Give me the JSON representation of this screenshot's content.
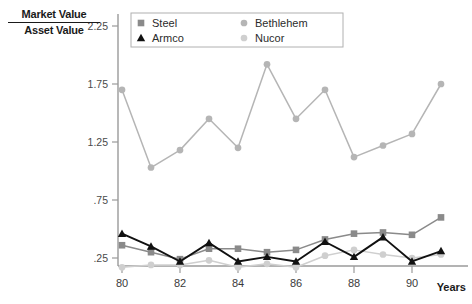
{
  "chart_data": {
    "type": "line",
    "title": "",
    "subtitle": "",
    "ylabel_numerator": "Market Value",
    "ylabel_denominator": "Asset Value",
    "xlabel": "Years",
    "x": [
      80,
      81,
      82,
      83,
      84,
      85,
      86,
      87,
      88,
      89,
      90,
      91
    ],
    "xtick_labels": [
      "80",
      "82",
      "84",
      "86",
      "88",
      "90"
    ],
    "xtick_values": [
      80,
      82,
      84,
      86,
      88,
      90
    ],
    "xlim": [
      79.5,
      91.5
    ],
    "ytick_labels": [
      "2.25",
      "1.75",
      "1.25",
      ".75",
      ".25"
    ],
    "ytick_values": [
      2.25,
      1.75,
      1.25,
      0.75,
      0.25
    ],
    "ylim": [
      0.0,
      2.45
    ],
    "grid": false,
    "legend_position": "top-right",
    "series": [
      {
        "name": "Steel",
        "color": "#8a8a8a",
        "marker": "square",
        "values": [
          0.36,
          0.3,
          0.24,
          0.33,
          0.33,
          0.3,
          0.32,
          0.41,
          0.46,
          0.47,
          0.45,
          0.6
        ]
      },
      {
        "name": "Armco",
        "color": "#111111",
        "marker": "triangle",
        "values": [
          0.46,
          0.35,
          0.22,
          0.38,
          0.22,
          0.26,
          0.22,
          0.39,
          0.26,
          0.43,
          0.22,
          0.31
        ]
      },
      {
        "name": "Bethlehem",
        "color": "#b5b5b5",
        "marker": "circle",
        "values": [
          1.7,
          1.03,
          1.18,
          1.45,
          1.2,
          1.92,
          1.45,
          1.7,
          1.12,
          1.22,
          1.32,
          1.75
        ]
      },
      {
        "name": "Nucor",
        "color": "#cfcfcf",
        "marker": "circle",
        "values": [
          0.17,
          0.19,
          0.19,
          0.23,
          0.17,
          0.2,
          0.17,
          0.27,
          0.32,
          0.28,
          0.25,
          0.28
        ]
      }
    ]
  },
  "legend": {
    "entries": [
      {
        "label": "Steel"
      },
      {
        "label": "Bethlehem"
      },
      {
        "label": "Armco"
      },
      {
        "label": "Nucor"
      }
    ]
  },
  "colors": {
    "axis": "#9a9a9a",
    "text": "#1a1a1a",
    "background": "#ffffff"
  }
}
